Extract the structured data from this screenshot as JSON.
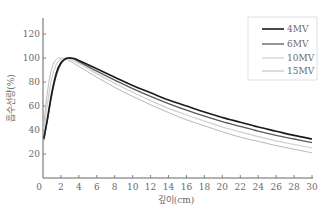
{
  "chart_data": {
    "type": "line",
    "title": "",
    "xlabel": "깊이(cm)",
    "ylabel": "흡수선량(%)",
    "xlim": [
      0,
      30
    ],
    "ylim": [
      0,
      135
    ],
    "x_ticks": [
      0,
      2,
      4,
      6,
      8,
      10,
      12,
      14,
      16,
      18,
      20,
      22,
      24,
      26,
      28,
      30
    ],
    "y_ticks": [
      20,
      40,
      60,
      80,
      100,
      120
    ],
    "grid": false,
    "legend_position": "top-right",
    "series": [
      {
        "name": "4MV",
        "color": "#1a1a1a",
        "width": 1.6,
        "points": [
          [
            0.1,
            33
          ],
          [
            0.5,
            50
          ],
          [
            1.0,
            72
          ],
          [
            1.5,
            88
          ],
          [
            2.0,
            96
          ],
          [
            2.5,
            99.5
          ],
          [
            3.0,
            100
          ],
          [
            3.5,
            99.5
          ],
          [
            4,
            98
          ],
          [
            6,
            91
          ],
          [
            8,
            84
          ],
          [
            10,
            77
          ],
          [
            12,
            71
          ],
          [
            14,
            65
          ],
          [
            16,
            60
          ],
          [
            18,
            55
          ],
          [
            20,
            50.5
          ],
          [
            22,
            46.5
          ],
          [
            24,
            42.5
          ],
          [
            26,
            39
          ],
          [
            28,
            35.5
          ],
          [
            30,
            32.5
          ]
        ]
      },
      {
        "name": "6MV",
        "color": "#5a5a5a",
        "width": 1.3,
        "points": [
          [
            0.1,
            32
          ],
          [
            0.5,
            48
          ],
          [
            1.0,
            70
          ],
          [
            1.5,
            86
          ],
          [
            2.0,
            95
          ],
          [
            2.5,
            99
          ],
          [
            3.0,
            100
          ],
          [
            3.5,
            99
          ],
          [
            4,
            97
          ],
          [
            6,
            89
          ],
          [
            8,
            81.5
          ],
          [
            10,
            74.5
          ],
          [
            12,
            68
          ],
          [
            14,
            62
          ],
          [
            16,
            56.5
          ],
          [
            18,
            51.5
          ],
          [
            20,
            47
          ],
          [
            22,
            43
          ],
          [
            24,
            39
          ],
          [
            26,
            35.5
          ],
          [
            28,
            32.5
          ],
          [
            30,
            29.5
          ]
        ]
      },
      {
        "name": "10MV",
        "color": "#cfcfcf",
        "width": 1.2,
        "points": [
          [
            0.1,
            40
          ],
          [
            0.5,
            62
          ],
          [
            1.0,
            84
          ],
          [
            1.5,
            95
          ],
          [
            2.0,
            99
          ],
          [
            2.5,
            100
          ],
          [
            3.0,
            99
          ],
          [
            4,
            95.5
          ],
          [
            6,
            87
          ],
          [
            8,
            79
          ],
          [
            10,
            71.5
          ],
          [
            12,
            64.5
          ],
          [
            14,
            58
          ],
          [
            16,
            52.5
          ],
          [
            18,
            47.5
          ],
          [
            20,
            42.5
          ],
          [
            22,
            38.5
          ],
          [
            24,
            34.5
          ],
          [
            26,
            31
          ],
          [
            28,
            28
          ],
          [
            30,
            25
          ]
        ]
      },
      {
        "name": "15MV",
        "color": "#b8b8b8",
        "width": 1.0,
        "points": [
          [
            0.1,
            45
          ],
          [
            0.5,
            72
          ],
          [
            1.0,
            92
          ],
          [
            1.5,
            99
          ],
          [
            2.0,
            100
          ],
          [
            2.5,
            99
          ],
          [
            3.0,
            97.5
          ],
          [
            4,
            93
          ],
          [
            6,
            84
          ],
          [
            8,
            75.5
          ],
          [
            10,
            68
          ],
          [
            12,
            61
          ],
          [
            14,
            54.5
          ],
          [
            16,
            48.5
          ],
          [
            18,
            43.5
          ],
          [
            20,
            38.5
          ],
          [
            22,
            34
          ],
          [
            24,
            30.5
          ],
          [
            26,
            27
          ],
          [
            28,
            24
          ],
          [
            30,
            21
          ]
        ]
      }
    ]
  },
  "legend": {
    "items": [
      {
        "label": "4MV"
      },
      {
        "label": "6MV"
      },
      {
        "label": "10MV"
      },
      {
        "label": "15MV"
      }
    ]
  },
  "axes": {
    "x_label": "깊이(cm)",
    "y_label": "흡수선량(%)"
  }
}
